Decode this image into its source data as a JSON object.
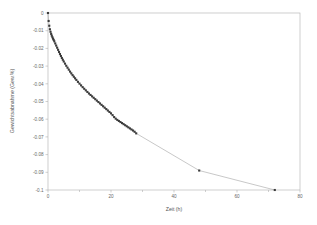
{
  "chart_data": {
    "type": "scatter",
    "title": "",
    "xlabel": "Zeit (h)",
    "ylabel": "Gewichtsabnahme (Gew.%)",
    "xlim": [
      0,
      80
    ],
    "ylim": [
      -0.1,
      0
    ],
    "grid": false,
    "legend": null,
    "x_ticks": [
      0,
      20,
      40,
      60,
      80
    ],
    "x_tick_labels": [
      "0",
      "20",
      "40",
      "60",
      "80"
    ],
    "x_minor_ticks": [
      10,
      30,
      50,
      70
    ],
    "y_ticks": [
      0,
      -0.01,
      -0.02,
      -0.03,
      -0.04,
      -0.05,
      -0.06,
      -0.07,
      -0.08,
      -0.09,
      -0.1
    ],
    "y_tick_labels": [
      "0",
      "-0.01",
      "-0.02",
      "-0.03",
      "-0.04",
      "-0.05",
      "-0.06",
      "-0.07",
      "-0.08",
      "-0.09",
      "-0.1"
    ],
    "marker": "square",
    "marker_color": "#3b3b3b",
    "line_color": "#9a9a9a",
    "series": [
      {
        "name": "Gewichtsabnahme",
        "x": [
          0.0,
          0.2,
          0.4,
          0.6,
          0.8,
          1.0,
          1.2,
          1.4,
          1.6,
          1.8,
          2.0,
          2.3,
          2.6,
          2.9,
          3.2,
          3.5,
          3.8,
          4.1,
          4.4,
          4.7,
          5.0,
          5.4,
          5.8,
          6.2,
          6.6,
          7.0,
          7.4,
          7.8,
          8.2,
          8.6,
          9.0,
          9.5,
          10.0,
          10.5,
          11.0,
          11.5,
          12.0,
          12.5,
          13.0,
          13.5,
          14.0,
          14.5,
          15.0,
          15.5,
          16.0,
          16.5,
          17.0,
          17.5,
          18.0,
          18.5,
          19.0,
          19.5,
          20.0,
          20.5,
          21.0,
          21.5,
          22.0,
          22.5,
          23.0,
          23.5,
          24.0,
          24.5,
          25.0,
          25.5,
          26.0,
          26.5,
          27.0,
          27.5,
          28.0,
          48.0,
          72.0
        ],
        "y": [
          0.0,
          -0.0045,
          -0.0072,
          -0.0092,
          -0.0106,
          -0.0118,
          -0.0128,
          -0.0137,
          -0.0145,
          -0.0152,
          -0.016,
          -0.0172,
          -0.0184,
          -0.0196,
          -0.0208,
          -0.022,
          -0.0232,
          -0.0243,
          -0.0254,
          -0.0264,
          -0.0274,
          -0.0286,
          -0.0298,
          -0.0309,
          -0.032,
          -0.0331,
          -0.0341,
          -0.0351,
          -0.036,
          -0.0369,
          -0.0378,
          -0.0389,
          -0.0399,
          -0.0409,
          -0.0419,
          -0.0428,
          -0.0437,
          -0.0446,
          -0.0455,
          -0.0463,
          -0.0471,
          -0.0479,
          -0.0487,
          -0.0495,
          -0.0503,
          -0.0511,
          -0.0519,
          -0.0527,
          -0.0535,
          -0.0543,
          -0.0551,
          -0.0559,
          -0.0567,
          -0.0577,
          -0.0588,
          -0.0597,
          -0.0604,
          -0.061,
          -0.0616,
          -0.0622,
          -0.0628,
          -0.0634,
          -0.064,
          -0.0646,
          -0.0652,
          -0.0658,
          -0.0664,
          -0.0671,
          -0.068,
          -0.089,
          -0.1
        ]
      }
    ]
  }
}
